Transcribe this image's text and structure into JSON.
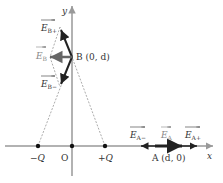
{
  "diagram": {
    "axes": {
      "x_label": "x",
      "y_label": "y",
      "origin_label": "O"
    },
    "charges": {
      "negative": {
        "label": "−Q"
      },
      "positive": {
        "label": "+Q"
      }
    },
    "points": {
      "B": {
        "label": "B (0, d)"
      },
      "A": {
        "label": "A (d, 0)"
      }
    },
    "vectors": {
      "E_B_plus": {
        "label": "E",
        "sub": "B+"
      },
      "E_B_minus": {
        "label": "E",
        "sub": "B−"
      },
      "E_B": {
        "label": "E",
        "sub": "B"
      },
      "E_A_minus": {
        "label": "E",
        "sub": "A−"
      },
      "E_A": {
        "label": "E",
        "sub": "A"
      },
      "E_A_plus": {
        "label": "E",
        "sub": "A+"
      }
    },
    "colors": {
      "axis": "#999999",
      "arrow": "#222222",
      "resultant": "#666666",
      "dashed": "#888888",
      "text": "#333333"
    }
  }
}
